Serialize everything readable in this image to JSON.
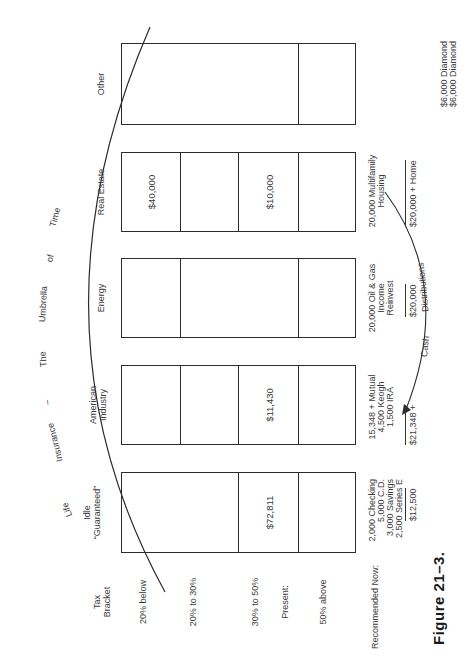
{
  "figure": {
    "caption": "Figure 21–3.",
    "umbrella_arc": {
      "words": [
        "Life",
        "Insurance",
        "–",
        "The",
        "Umbrella",
        "of",
        "Time"
      ]
    },
    "cash_arc": {
      "words": [
        "Cash",
        "Distributions"
      ]
    }
  },
  "rows": {
    "header": "Tax\nBracket",
    "header_line1": "Tax",
    "header_line2": "Bracket",
    "labels": [
      "20% below",
      "20% to 30%",
      "30% to 50%",
      "Present:",
      "50% above"
    ],
    "recommended": "Recommended Now:"
  },
  "columns": [
    {
      "header_line1": "Idle",
      "header_line2": "“Guaranteed”",
      "present_value": "$72,811",
      "recommended_lines": [
        "2,000 Checking",
        "5,000 C.D.",
        "3,000 Savings",
        "2,500 Series E"
      ],
      "total": "$12,500"
    },
    {
      "header_line1": "American",
      "header_line2": "Industry",
      "present_value": "$11,430",
      "recommended_lines": [
        "15,348 + Mutual",
        "4,500 Keogh",
        "1,500 IRA"
      ],
      "total": "$21,348 +"
    },
    {
      "header_line1": "Energy",
      "header_line2": "",
      "present_value": "",
      "recommended_lines": [
        "20,000 Oil & Gas",
        "Income",
        "Reinvest"
      ],
      "total": "$20,000"
    },
    {
      "header_line1": "Real Estate",
      "header_line2": "",
      "top_value": "$40,000",
      "present_value": "$10,000",
      "recommended_lines": [
        "20,000 Multifamily",
        "Housing"
      ],
      "total": "$20,000 + Home"
    },
    {
      "header_line1": "Other",
      "header_line2": "",
      "present_value": "",
      "recommended_lines": [],
      "total": "",
      "extra_lines": [
        "$6,000 Diamond",
        "$6,000 Diamond"
      ]
    }
  ],
  "colors": {
    "ink": "#2b2b2b",
    "paper": "#ffffff"
  }
}
